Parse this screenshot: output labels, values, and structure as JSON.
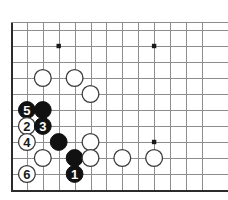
{
  "board": {
    "kind": "go-board-diagram",
    "description": "Go joseki diagram, lower-left corner, 6 numbered moves",
    "grid": {
      "columns": 13,
      "rows": 11,
      "origin_x": 11,
      "origin_y": 30,
      "spacing_x": 15.9,
      "spacing_y": 16.0,
      "top_border_y": 22,
      "left_edge_col": 0,
      "bottom_edge_row": 10
    },
    "colors": {
      "background": "#ffffff",
      "grid_line": "#8d8d8d",
      "board_edge": "#2b2b2b",
      "black_stone": "#111111",
      "white_stone": "#ffffff",
      "white_stone_outline": "#3a3a3a",
      "star_point": "#1a1a1a"
    },
    "stone_radius": 8.4,
    "star_points": [
      {
        "name": "star-point-upper-left",
        "col": 3,
        "row": 1
      },
      {
        "name": "star-point-upper-right",
        "col": 9,
        "row": 1
      },
      {
        "name": "star-point-lower-right",
        "col": 9,
        "row": 7
      }
    ],
    "stones": [
      {
        "id": "white-a",
        "color": "white",
        "col": 2,
        "row": 3,
        "label": ""
      },
      {
        "id": "white-b",
        "color": "white",
        "col": 4,
        "row": 3,
        "label": ""
      },
      {
        "id": "white-c",
        "color": "white",
        "col": 5,
        "row": 4,
        "label": ""
      },
      {
        "id": "black-move-5",
        "color": "black",
        "col": 1,
        "row": 5,
        "label": "5"
      },
      {
        "id": "black-d",
        "color": "black",
        "col": 2,
        "row": 5,
        "label": ""
      },
      {
        "id": "white-move-2",
        "color": "white",
        "col": 1,
        "row": 6,
        "label": "2"
      },
      {
        "id": "black-move-3",
        "color": "black",
        "col": 2,
        "row": 6,
        "label": "3"
      },
      {
        "id": "white-move-4",
        "color": "white",
        "col": 1,
        "row": 7,
        "label": "4"
      },
      {
        "id": "black-e",
        "color": "black",
        "col": 3,
        "row": 7,
        "label": ""
      },
      {
        "id": "white-d",
        "color": "white",
        "col": 5,
        "row": 7,
        "label": ""
      },
      {
        "id": "white-e",
        "color": "white",
        "col": 2,
        "row": 8,
        "label": ""
      },
      {
        "id": "black-f",
        "color": "black",
        "col": 4,
        "row": 8,
        "label": ""
      },
      {
        "id": "white-f",
        "color": "white",
        "col": 5,
        "row": 8,
        "label": ""
      },
      {
        "id": "white-g",
        "color": "white",
        "col": 7,
        "row": 8,
        "label": ""
      },
      {
        "id": "white-h",
        "color": "white",
        "col": 9,
        "row": 8,
        "label": ""
      },
      {
        "id": "white-move-6",
        "color": "white",
        "col": 1,
        "row": 9,
        "label": "6"
      },
      {
        "id": "black-move-1",
        "color": "black",
        "col": 4,
        "row": 9,
        "label": "1"
      }
    ],
    "move_sequence": [
      {
        "number": "1",
        "color": "black"
      },
      {
        "number": "2",
        "color": "white"
      },
      {
        "number": "3",
        "color": "black"
      },
      {
        "number": "4",
        "color": "white"
      },
      {
        "number": "5",
        "color": "black"
      },
      {
        "number": "6",
        "color": "white"
      }
    ]
  }
}
